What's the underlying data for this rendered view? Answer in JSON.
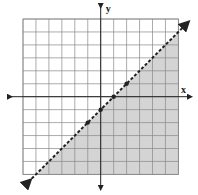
{
  "chart_data": {
    "type": "line",
    "title": "",
    "xlabel": "x",
    "ylabel": "y",
    "xlim": [
      -6,
      6
    ],
    "ylim": [
      -6,
      6
    ],
    "grid": true,
    "grid_step": 1,
    "boundary_line": {
      "equation": "y = x - 1",
      "slope": 1,
      "intercept": -1,
      "style": "dashed",
      "arrows": "both"
    },
    "inequality": "y < x - 1",
    "shaded_region": "below line",
    "points": [
      {
        "x": -1,
        "y": -2
      },
      {
        "x": 0,
        "y": -1
      },
      {
        "x": 1,
        "y": 0
      },
      {
        "x": 2,
        "y": 1
      }
    ]
  },
  "axes": {
    "x_label": "x",
    "y_label": "y"
  },
  "colors": {
    "grid": "#888888",
    "axis": "#222222",
    "shade": "#d4d4d4",
    "line": "#222222",
    "background": "#ffffff"
  }
}
